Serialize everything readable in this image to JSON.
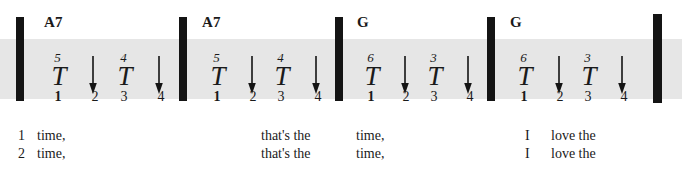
{
  "notation": {
    "title": "Strum pattern with chords and lyrics",
    "staff_band_color": "#e6e6e6",
    "ink_color": "#141414",
    "barlines": [
      {
        "name": "barline-1",
        "x": 16,
        "final": false
      },
      {
        "name": "barline-2",
        "x": 179,
        "final": false
      },
      {
        "name": "barline-3",
        "x": 335,
        "final": false
      },
      {
        "name": "barline-4",
        "x": 487,
        "final": false
      },
      {
        "name": "barline-5",
        "x": 653,
        "final": true
      }
    ],
    "measures": [
      {
        "name": "measure-1",
        "chord": "A7",
        "chord_x": 44,
        "strums": [
          {
            "type": "T",
            "string": "5",
            "x": 42
          },
          {
            "type": "arrow",
            "x": 84
          },
          {
            "type": "T",
            "string": "4",
            "x": 108
          },
          {
            "type": "arrow",
            "x": 150
          }
        ],
        "beats": [
          {
            "label": "1",
            "x": 46,
            "bold": true
          },
          {
            "label": "2",
            "x": 83,
            "bold": false
          },
          {
            "label": "3",
            "x": 112,
            "bold": false
          },
          {
            "label": "4",
            "x": 149,
            "bold": false
          }
        ]
      },
      {
        "name": "measure-2",
        "chord": "A7",
        "chord_x": 202,
        "strums": [
          {
            "type": "T",
            "string": "5",
            "x": 201
          },
          {
            "type": "arrow",
            "x": 243
          },
          {
            "type": "T",
            "string": "4",
            "x": 265
          },
          {
            "type": "arrow",
            "x": 307
          }
        ],
        "beats": [
          {
            "label": "1",
            "x": 205,
            "bold": true
          },
          {
            "label": "2",
            "x": 241,
            "bold": false
          },
          {
            "label": "3",
            "x": 269,
            "bold": false
          },
          {
            "label": "4",
            "x": 306,
            "bold": false
          }
        ]
      },
      {
        "name": "measure-3",
        "chord": "G",
        "chord_x": 357,
        "strums": [
          {
            "type": "T",
            "string": "6",
            "x": 355
          },
          {
            "type": "arrow",
            "x": 396
          },
          {
            "type": "T",
            "string": "3",
            "x": 418
          },
          {
            "type": "arrow",
            "x": 459
          }
        ],
        "beats": [
          {
            "label": "1",
            "x": 359,
            "bold": true
          },
          {
            "label": "2",
            "x": 394,
            "bold": false
          },
          {
            "label": "3",
            "x": 422,
            "bold": false
          },
          {
            "label": "4",
            "x": 458,
            "bold": false
          }
        ]
      },
      {
        "name": "measure-4",
        "chord": "G",
        "chord_x": 510,
        "strums": [
          {
            "type": "T",
            "string": "6",
            "x": 508
          },
          {
            "type": "arrow",
            "x": 550
          },
          {
            "type": "T",
            "string": "3",
            "x": 572
          },
          {
            "type": "arrow",
            "x": 613
          }
        ],
        "beats": [
          {
            "label": "1",
            "x": 512,
            "bold": true
          },
          {
            "label": "2",
            "x": 548,
            "bold": false
          },
          {
            "label": "3",
            "x": 576,
            "bold": false
          },
          {
            "label": "4",
            "x": 612,
            "bold": false
          }
        ]
      }
    ],
    "lyrics": [
      {
        "name": "lyric-verse-1-ending-1",
        "row": 1,
        "x": 18,
        "text": "1"
      },
      {
        "name": "lyric-verse-1-word-time",
        "row": 1,
        "x": 37,
        "text": "time,"
      },
      {
        "name": "lyric-verse-1-word-thats-the",
        "row": 1,
        "x": 261,
        "text": "that's  the"
      },
      {
        "name": "lyric-verse-1-word-time-2",
        "row": 1,
        "x": 356,
        "text": "time,"
      },
      {
        "name": "lyric-verse-1-word-i",
        "row": 1,
        "x": 525,
        "text": "I"
      },
      {
        "name": "lyric-verse-1-word-love-the",
        "row": 1,
        "x": 551,
        "text": "love  the"
      },
      {
        "name": "lyric-verse-2-ending-2",
        "row": 2,
        "x": 18,
        "text": "2"
      },
      {
        "name": "lyric-verse-2-word-time",
        "row": 2,
        "x": 37,
        "text": "time,"
      },
      {
        "name": "lyric-verse-2-word-thats-the",
        "row": 2,
        "x": 261,
        "text": "that's  the"
      },
      {
        "name": "lyric-verse-2-word-time-2",
        "row": 2,
        "x": 356,
        "text": "time,"
      },
      {
        "name": "lyric-verse-2-word-i",
        "row": 2,
        "x": 525,
        "text": "I"
      },
      {
        "name": "lyric-verse-2-word-love-the",
        "row": 2,
        "x": 551,
        "text": "love  the"
      }
    ]
  }
}
